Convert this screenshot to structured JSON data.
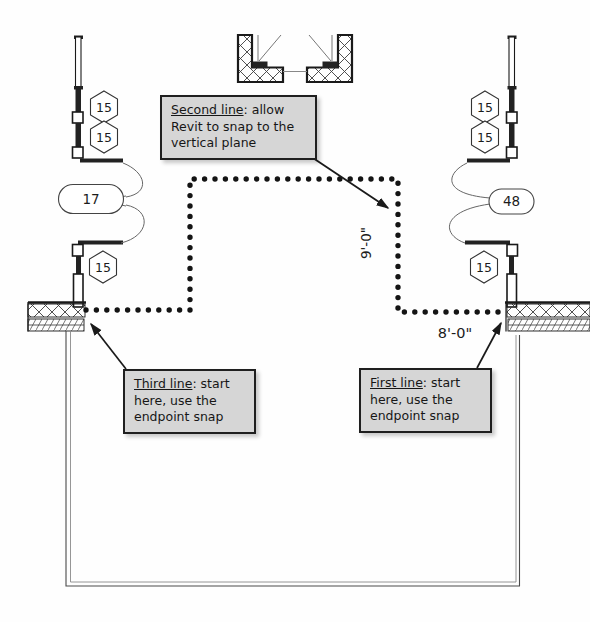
{
  "tags": {
    "window": "15",
    "left_door": "17",
    "right_door": "48"
  },
  "dimensions": {
    "vertical": "9'-0\"",
    "horizontal": "8'-0\""
  },
  "callouts": {
    "second": {
      "lead": "Second line",
      "after_lead": ": allow",
      "line2": "Revit to snap to the",
      "line3": "vertical plane"
    },
    "third": {
      "lead": "Third line",
      "after_lead": ": start",
      "line2": "here, use the",
      "line3": "endpoint snap"
    },
    "first": {
      "lead": "First line",
      "after_lead": ": start",
      "line2": "here, use the",
      "line3": "endpoint snap"
    }
  },
  "colors": {
    "wall_line": "#1a1a1a",
    "sketch_dot": "#141414",
    "callout_fill": "#d6d6d6",
    "arrow": "#1a1a1a"
  }
}
